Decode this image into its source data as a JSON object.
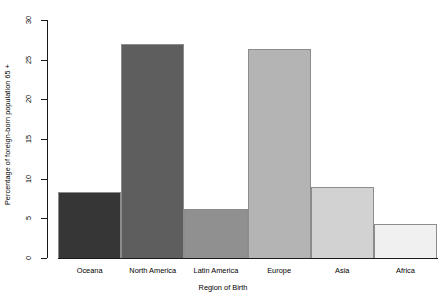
{
  "chart_data": {
    "type": "bar",
    "title": "",
    "xlabel": "Region of Birth",
    "ylabel": "Percentage of foreign-born population 65 +",
    "categories": [
      "Oceana",
      "North America",
      "Latin America",
      "Europe",
      "Asia",
      "Africa"
    ],
    "values": [
      8.3,
      27.0,
      6.2,
      26.3,
      9.0,
      4.3
    ],
    "bar_colors": [
      "#363636",
      "#5e5e5e",
      "#909090",
      "#b4b4b4",
      "#d2d2d2",
      "#f0f0f0"
    ],
    "bar_border_color": "#8c8c8c",
    "ylim": [
      0,
      30
    ],
    "yticks": [
      0,
      5,
      10,
      15,
      20,
      25,
      30
    ],
    "ytick_labels": [
      "0",
      "5",
      "10",
      "15",
      "20",
      "25",
      "30"
    ],
    "grid": false,
    "legend": false,
    "axis_color": "#1a1a1a",
    "background": "#ffffff"
  }
}
